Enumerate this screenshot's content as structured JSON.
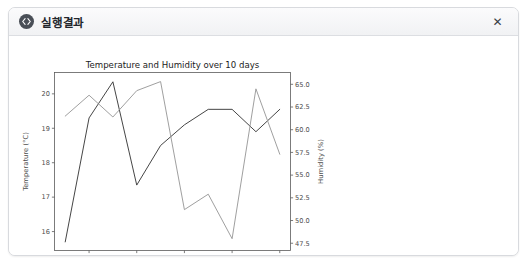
{
  "window": {
    "title": "실행결과",
    "icon": "code-icon",
    "close_label": "✕",
    "border_color": "#d8dade",
    "titlebar_bg": "#f1f2f4"
  },
  "chart_data": {
    "type": "line",
    "title": "Temperature and Humidity over 10 days",
    "xlabel": "Day",
    "grid": false,
    "legend": "none",
    "x": [
      1,
      2,
      3,
      4,
      5,
      6,
      7,
      8,
      9,
      10
    ],
    "xlim": [
      0.55,
      10.45
    ],
    "xticks": [
      2,
      4,
      6,
      8,
      10
    ],
    "xtick_labels": [
      "2",
      "4",
      "6",
      "8",
      "10"
    ],
    "axes": [
      {
        "id": "left",
        "label": "Temperature (°C)",
        "ylim": [
          15.45,
          20.62
        ],
        "ticks": [
          16,
          17,
          18,
          19,
          20
        ],
        "tick_labels": [
          "16",
          "17",
          "18",
          "19",
          "20"
        ],
        "color": "#3b3b3b"
      },
      {
        "id": "right",
        "label": "Humidity (%)",
        "ylim": [
          46.7,
          66.3
        ],
        "ticks": [
          47.5,
          50.0,
          52.5,
          55.0,
          57.5,
          60.0,
          62.5,
          65.0
        ],
        "tick_labels": [
          "47.5",
          "50.0",
          "52.5",
          "55.0",
          "57.5",
          "60.0",
          "62.5",
          "65.0"
        ],
        "color": "#8a8a8a"
      }
    ],
    "series": [
      {
        "name": "Temperature (°C)",
        "axis": "left",
        "color": "#3b3b3b",
        "values": [
          15.7,
          19.3,
          20.35,
          17.35,
          18.5,
          19.1,
          19.55,
          19.55,
          18.9,
          19.55
        ]
      },
      {
        "name": "Humidity (%)",
        "axis": "right",
        "color": "#9a9a9a",
        "values": [
          61.5,
          63.8,
          61.4,
          64.3,
          65.3,
          51.2,
          52.9,
          48.0,
          64.5,
          57.3
        ]
      }
    ]
  }
}
